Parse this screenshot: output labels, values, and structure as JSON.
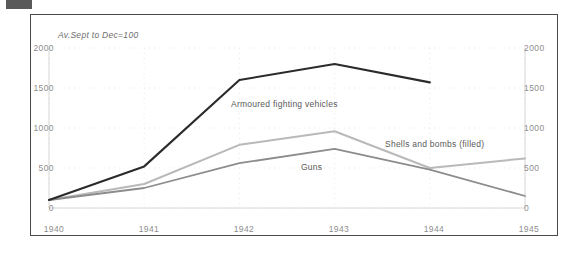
{
  "figure": {
    "note": "Av.Sept to Dec=100",
    "background": "#ffffff",
    "border_color": "#4a4a4a"
  },
  "axes": {
    "y_left_ticks": [
      "2000",
      "1500",
      "1000",
      "500",
      "0"
    ],
    "y_right_ticks": [
      "2000",
      "1500",
      "1000",
      "500",
      "0"
    ],
    "x_ticks": [
      "1940",
      "1941",
      "1942",
      "1943",
      "1944",
      "1945"
    ]
  },
  "labels": {
    "armoured": "Armoured fighting vehicles",
    "shells": "Shells and bombs (filled)",
    "guns": "Guns"
  },
  "colors": {
    "armoured": "#2b2b2b",
    "shells": "#b9b9b9",
    "guns": "#8c8c8c",
    "grid": "#e9e9e9",
    "tick_text": "#8d8d8d"
  },
  "chart_data": {
    "type": "line",
    "title": "",
    "subtitle": "Av.Sept to Dec=100",
    "xlabel": "",
    "ylabel": "",
    "x": [
      1940,
      1941,
      1942,
      1943,
      1944,
      1945
    ],
    "xlim": [
      1940,
      1945
    ],
    "ylim": [
      0,
      2000
    ],
    "ytick_values": [
      0,
      500,
      1000,
      1500,
      2000
    ],
    "y_axis_dual": true,
    "grid": "dotted-light",
    "legend": "inline-annotations",
    "series": [
      {
        "name": "Armoured fighting vehicles",
        "color": "#2b2b2b",
        "width": 2.1,
        "values": [
          100,
          520,
          1600,
          1800,
          1570,
          null
        ]
      },
      {
        "name": "Shells and bombs (filled)",
        "color": "#b9b9b9",
        "width": 2.0,
        "values": [
          100,
          300,
          790,
          960,
          500,
          620
        ]
      },
      {
        "name": "Guns",
        "color": "#8c8c8c",
        "width": 1.8,
        "values": [
          100,
          250,
          560,
          740,
          480,
          150
        ]
      }
    ]
  }
}
